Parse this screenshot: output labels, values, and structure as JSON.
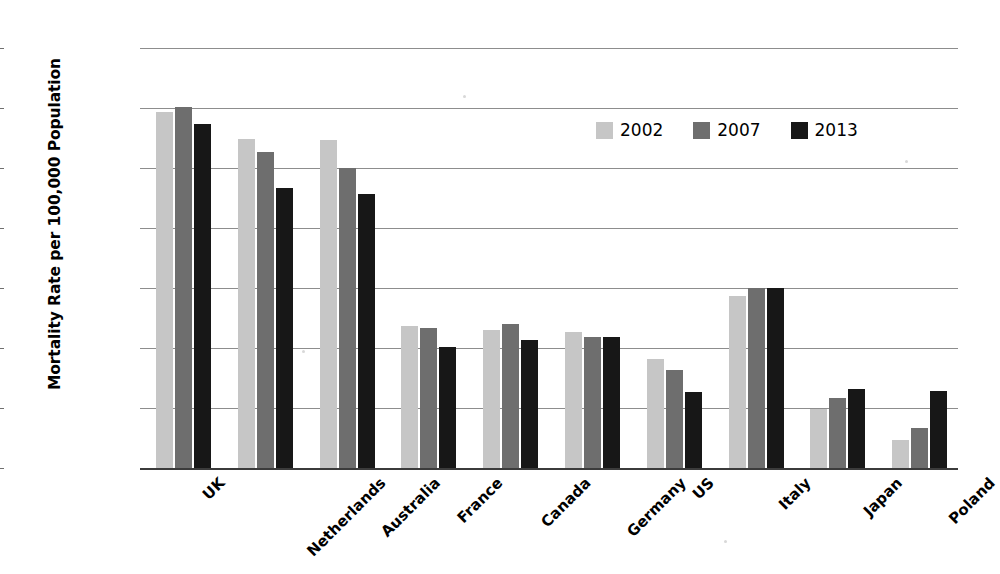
{
  "chart_data": {
    "type": "bar",
    "title": "",
    "xlabel": "",
    "ylabel": "Mortality Rate per 100,000 Population",
    "ylim": [
      0.0,
      3.5
    ],
    "ytick_labels": [
      "0.0",
      "0.5",
      "1.0",
      "1.5",
      "2.0",
      "2.5",
      "3.0",
      "3.5"
    ],
    "ytick_values": [
      0.0,
      0.5,
      1.0,
      1.5,
      2.0,
      2.5,
      3.0,
      3.5
    ],
    "grid": true,
    "legend_position": "upper right inside",
    "categories": [
      "UK",
      "Netherlands",
      "Australia",
      "France",
      "Canada",
      "Germany",
      "US",
      "Italy",
      "Japan",
      "Poland"
    ],
    "series": [
      {
        "name": "2002",
        "color": "#c6c6c6",
        "values": [
          2.97,
          2.74,
          2.73,
          1.18,
          1.15,
          1.13,
          0.91,
          1.43,
          0.49,
          0.23
        ]
      },
      {
        "name": "2007",
        "color": "#6e6e6e",
        "values": [
          3.01,
          2.63,
          2.5,
          1.17,
          1.2,
          1.09,
          0.82,
          1.5,
          0.58,
          0.33
        ]
      },
      {
        "name": "2013",
        "color": "#171717",
        "values": [
          2.87,
          2.33,
          2.28,
          1.01,
          1.07,
          1.09,
          0.63,
          1.5,
          0.66,
          0.64
        ]
      }
    ]
  },
  "legend": {
    "items": [
      {
        "label": "2002",
        "color": "#c6c6c6"
      },
      {
        "label": "2007",
        "color": "#6e6e6e"
      },
      {
        "label": "2013",
        "color": "#171717"
      }
    ]
  },
  "axes": {
    "y_title": "Mortality Rate per 100,000 Population"
  }
}
